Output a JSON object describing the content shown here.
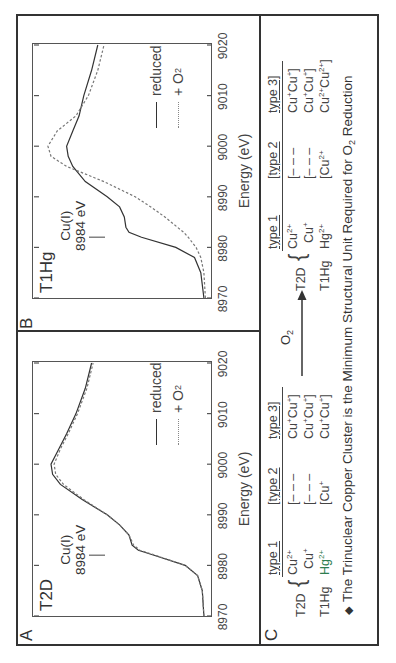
{
  "figure": {
    "orientation": "rotated-90-ccw",
    "panels": {
      "A": {
        "letter": "A",
        "sample": "T2D",
        "annotation_line1": "Cu(I)",
        "annotation_line2": "8984 eV",
        "xlabel": "Energy (eV)",
        "xticks": [
          "8970",
          "8980",
          "8990",
          "9000",
          "9010",
          "9020"
        ],
        "legend": {
          "reduced": "reduced",
          "oxidized": "+ O",
          "oxidized_sub": "2"
        }
      },
      "B": {
        "letter": "B",
        "sample": "T1Hg",
        "annotation_line1": "Cu(I)",
        "annotation_line2": "8984 eV",
        "xlabel": "Energy (eV)",
        "xticks": [
          "8970",
          "8980",
          "8990",
          "9000",
          "9010",
          "9020"
        ],
        "legend": {
          "reduced": "reduced",
          "oxidized": "+ O",
          "oxidized_sub": "2"
        }
      },
      "C": {
        "letter": "C",
        "arrow_label": "O",
        "arrow_label_sub": "2",
        "left_table": {
          "headers": [
            "type 1",
            "[type 2",
            "type 3]"
          ],
          "rows": [
            {
              "sample": "T2D",
              "t1": "Cu",
              "t1_sup": "2+",
              "t2": "[– – –",
              "t3": "Cu",
              "t3_sup": "+",
              "t3b": "Cu",
              "t3b_sup": "+",
              "t3_close": "]"
            },
            {
              "sample": "",
              "t1": "Cu",
              "t1_sup": "+",
              "t2": "[– – –",
              "t3": "Cu",
              "t3_sup": "+",
              "t3b": "Cu",
              "t3b_sup": "+",
              "t3_close": "]"
            },
            {
              "sample": "T1Hg",
              "t1": "Hg",
              "t1_sup": "2+",
              "t2": "[Cu",
              "t2_sup": "+",
              "t3": "Cu",
              "t3_sup": "+",
              "t3b": "Cu",
              "t3b_sup": "+",
              "t3_close": "]"
            }
          ]
        },
        "right_table": {
          "headers": [
            "type 1",
            "[type 2",
            "type 3]"
          ],
          "rows": [
            {
              "sample": "T2D",
              "t1": "Cu",
              "t1_sup": "2+",
              "t2": "[– – –",
              "t3": "Cu",
              "t3_sup": "+",
              "t3b": "Cu",
              "t3b_sup": "+",
              "t3_close": "]"
            },
            {
              "sample": "",
              "t1": "Cu",
              "t1_sup": "+",
              "t2": "[– – –",
              "t3": "Cu",
              "t3_sup": "+",
              "t3b": "Cu",
              "t3b_sup": "+",
              "t3_close": "]"
            },
            {
              "sample": "T1Hg",
              "t1": "Hg",
              "t1_sup": "2+",
              "t2": "[Cu",
              "t2_sup": "2+",
              "t3": "Cu",
              "t3_sup": "2+",
              "t3b": "Cu",
              "t3b_sup": "2+",
              "t3_close": "]"
            }
          ]
        },
        "caption_bullet": "◆",
        "caption": "The Trinuclear Copper Cluster is the Minimum Structural Unit Required for O",
        "caption_sub": "2",
        "caption_end": " Reduction"
      }
    },
    "colors": {
      "line": "#333333",
      "dashed": "#777777",
      "accent_hg": "#2e7d4f"
    }
  },
  "chart_data": [
    {
      "type": "line",
      "title": "A  T2D",
      "xlabel": "Energy (eV)",
      "ylabel": "",
      "xlim": [
        8970,
        9020
      ],
      "xticks": [
        8970,
        8980,
        8990,
        9000,
        9010,
        9020
      ],
      "grid": false,
      "legend": [
        "reduced",
        "+ O2"
      ],
      "legend_position": "upper right",
      "annotations": [
        {
          "text": "Cu(I) 8984 eV",
          "x": 8984
        }
      ],
      "x": [
        8970,
        8975,
        8978,
        8980,
        8982,
        8983,
        8984,
        8986,
        8988,
        8990,
        8993,
        8996,
        8998,
        9000,
        9003,
        9006,
        9010,
        9015,
        9020
      ],
      "series": [
        {
          "name": "reduced",
          "style": "solid",
          "values": [
            0.02,
            0.03,
            0.06,
            0.14,
            0.34,
            0.44,
            0.48,
            0.5,
            0.56,
            0.64,
            0.8,
            0.94,
            0.99,
            1.0,
            0.95,
            0.9,
            0.84,
            0.78,
            0.74
          ]
        },
        {
          "name": "+ O2",
          "style": "dashed",
          "values": [
            0.02,
            0.03,
            0.06,
            0.14,
            0.33,
            0.43,
            0.47,
            0.5,
            0.56,
            0.64,
            0.79,
            0.92,
            0.97,
            0.98,
            0.94,
            0.89,
            0.83,
            0.77,
            0.73
          ]
        }
      ]
    },
    {
      "type": "line",
      "title": "B  T1Hg",
      "xlabel": "Energy (eV)",
      "ylabel": "",
      "xlim": [
        8970,
        9020
      ],
      "xticks": [
        8970,
        8980,
        8990,
        9000,
        9010,
        9020
      ],
      "grid": false,
      "legend": [
        "reduced",
        "+ O2"
      ],
      "legend_position": "upper right",
      "annotations": [
        {
          "text": "Cu(I) 8984 eV",
          "x": 8984
        }
      ],
      "x": [
        8970,
        8975,
        8978,
        8980,
        8982,
        8983,
        8984,
        8986,
        8988,
        8990,
        8993,
        8996,
        8998,
        9000,
        9003,
        9006,
        9010,
        9015,
        9020
      ],
      "series": [
        {
          "name": "reduced",
          "style": "solid",
          "values": [
            0.02,
            0.04,
            0.08,
            0.2,
            0.42,
            0.5,
            0.52,
            0.53,
            0.56,
            0.64,
            0.78,
            0.86,
            0.89,
            0.9,
            0.86,
            0.82,
            0.79,
            0.74,
            0.7
          ]
        },
        {
          "name": "+ O2",
          "style": "dashed",
          "values": [
            0.01,
            0.02,
            0.04,
            0.07,
            0.12,
            0.15,
            0.19,
            0.27,
            0.36,
            0.46,
            0.66,
            0.9,
            1.0,
            1.02,
            0.96,
            0.84,
            0.76,
            0.7,
            0.66
          ]
        }
      ]
    }
  ]
}
